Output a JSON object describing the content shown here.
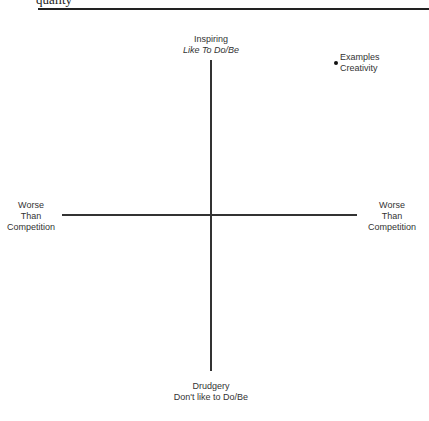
{
  "header": {
    "cut_text": "quality",
    "rule_color": "#222222"
  },
  "axes": {
    "top": {
      "line1": "Inspiring",
      "line2": "Like To Do/Be"
    },
    "bottom": {
      "line1": "Drudgery",
      "line2": "Don't like to Do/Be"
    },
    "left": {
      "line1": "Worse",
      "line2": "Than",
      "line3": "Competition"
    },
    "right": {
      "line1": "Worse",
      "line2": "Than",
      "line3": "Competition"
    }
  },
  "points": [
    {
      "line1": "Examples",
      "line2": "Creativity",
      "quadrant": "top-right"
    }
  ]
}
